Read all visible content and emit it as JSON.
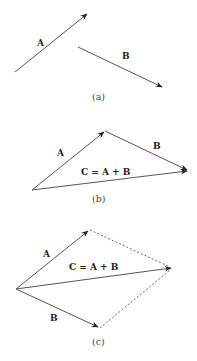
{
  "panels": [
    {
      "caption": "(a)",
      "labels": {
        "A": "A",
        "B": "B"
      }
    },
    {
      "caption": "(b)",
      "labels": {
        "A": "A",
        "B": "B",
        "C": "C = A + B"
      }
    },
    {
      "caption": "(c)",
      "labels": {
        "A": "A",
        "B": "B",
        "C": "C = A + B"
      }
    }
  ],
  "colors": {
    "vector": "#555555",
    "text": "#222222"
  }
}
